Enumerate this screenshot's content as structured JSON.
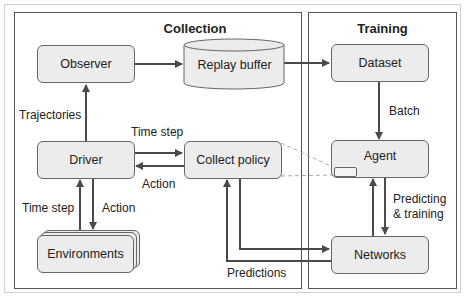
{
  "panels": {
    "collection": {
      "title": "Collection"
    },
    "training": {
      "title": "Training"
    }
  },
  "nodes": {
    "observer": "Observer",
    "replay_buffer": "Replay buffer",
    "dataset": "Dataset",
    "driver": "Driver",
    "collect_policy": "Collect policy",
    "agent": "Agent",
    "networks": "Networks",
    "environments": "Environments"
  },
  "edges": {
    "trajectories": "Trajectories",
    "time_step_driver_policy": "Time step",
    "action_policy_driver": "Action",
    "time_step_env_driver": "Time step",
    "action_driver_env": "Action",
    "batch": "Batch",
    "predicting_training_line1": "Predicting",
    "predicting_training_line2": "& training",
    "predictions": "Predictions"
  },
  "colors": {
    "box_fill": "#ececec",
    "box_border": "#666666",
    "arrow": "#4a4a4a",
    "dashed": "#aaaaaa"
  }
}
